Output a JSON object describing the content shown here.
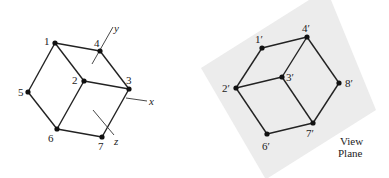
{
  "left_figure": {
    "vertices": [
      {
        "id": "1",
        "label": "1",
        "x": 55,
        "y": 43,
        "lx": 44,
        "ly": 45
      },
      {
        "id": "2",
        "label": "2",
        "x": 84,
        "y": 81,
        "lx": 72,
        "ly": 84
      },
      {
        "id": "3",
        "label": "3",
        "x": 129,
        "y": 89,
        "lx": 126,
        "ly": 84
      },
      {
        "id": "4",
        "label": "4",
        "x": 100,
        "y": 51,
        "lx": 94,
        "ly": 47
      },
      {
        "id": "5",
        "label": "5",
        "x": 28,
        "y": 92,
        "lx": 18,
        "ly": 96
      },
      {
        "id": "6",
        "label": "6",
        "x": 57,
        "y": 129,
        "lx": 48,
        "ly": 142
      },
      {
        "id": "7",
        "label": "7",
        "x": 102,
        "y": 137,
        "lx": 98,
        "ly": 150
      }
    ],
    "edges": [
      [
        "1",
        "4"
      ],
      [
        "1",
        "2"
      ],
      [
        "1",
        "5"
      ],
      [
        "4",
        "3"
      ],
      [
        "2",
        "3"
      ],
      [
        "2",
        "6"
      ],
      [
        "5",
        "6"
      ],
      [
        "6",
        "7"
      ],
      [
        "7",
        "3"
      ]
    ],
    "axes": [
      {
        "name": "y",
        "label": "y",
        "x1": 92,
        "y1": 64,
        "x2": 113,
        "y2": 27,
        "lx": 114,
        "ly": 32
      },
      {
        "name": "x",
        "label": "x",
        "x1": 126,
        "y1": 98,
        "x2": 147,
        "y2": 101,
        "lx": 149,
        "ly": 105
      },
      {
        "name": "z",
        "label": "z",
        "x1": 93,
        "y1": 110,
        "x2": 114,
        "y2": 135,
        "lx": 114,
        "ly": 145
      }
    ]
  },
  "right_figure": {
    "plane_label_line1": "View",
    "plane_label_line2": "Plane",
    "plane_color": "#ececec",
    "vertices": [
      {
        "id": "1p",
        "label": "1′",
        "x": 262,
        "y": 48,
        "lx": 255,
        "ly": 43
      },
      {
        "id": "2p",
        "label": "2′",
        "x": 236,
        "y": 88,
        "lx": 222,
        "ly": 92
      },
      {
        "id": "3p",
        "label": "3′",
        "x": 282,
        "y": 77,
        "lx": 286,
        "ly": 81
      },
      {
        "id": "4p",
        "label": "4′",
        "x": 307,
        "y": 37,
        "lx": 302,
        "ly": 32
      },
      {
        "id": "6p",
        "label": "6′",
        "x": 267,
        "y": 134,
        "lx": 262,
        "ly": 150
      },
      {
        "id": "7p",
        "label": "7′",
        "x": 313,
        "y": 123,
        "lx": 306,
        "ly": 137
      },
      {
        "id": "8p",
        "label": "8′",
        "x": 339,
        "y": 83,
        "lx": 345,
        "ly": 87
      }
    ],
    "edges": [
      [
        "1p",
        "4p"
      ],
      [
        "1p",
        "2p"
      ],
      [
        "2p",
        "3p"
      ],
      [
        "3p",
        "4p"
      ],
      [
        "4p",
        "8p"
      ],
      [
        "2p",
        "6p"
      ],
      [
        "3p",
        "7p"
      ],
      [
        "6p",
        "7p"
      ],
      [
        "7p",
        "8p"
      ]
    ]
  }
}
